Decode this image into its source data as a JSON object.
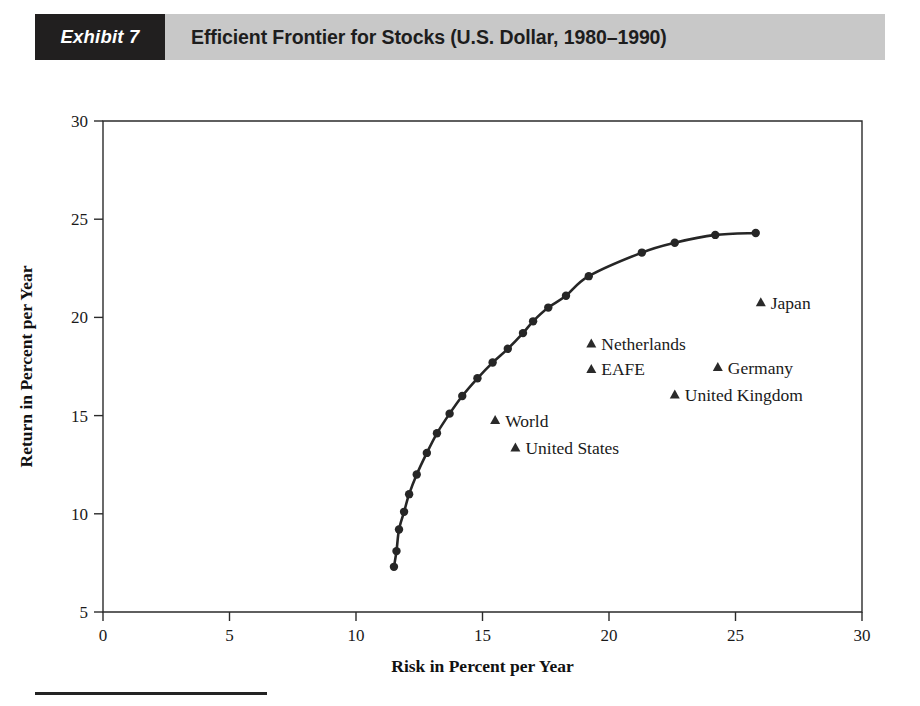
{
  "exhibit": {
    "tag": "Exhibit 7",
    "title": "Efficient Frontier for Stocks (U.S. Dollar, 1980–1990)"
  },
  "chart_data": {
    "type": "scatter",
    "title": "Efficient Frontier for Stocks (U.S. Dollar, 1980–1990)",
    "xlabel": "Risk in Percent per Year",
    "ylabel": "Return in Percent per Year",
    "xlim": [
      0,
      30
    ],
    "ylim": [
      5,
      30
    ],
    "xticks": [
      0,
      5,
      10,
      15,
      20,
      25,
      30
    ],
    "yticks": [
      5,
      10,
      15,
      20,
      25,
      30
    ],
    "grid": false,
    "legend": "none",
    "series": [
      {
        "name": "Efficient Frontier",
        "type": "line",
        "marker": "circle",
        "points": [
          [
            11.5,
            7.3
          ],
          [
            11.6,
            8.1
          ],
          [
            11.7,
            9.2
          ],
          [
            11.9,
            10.1
          ],
          [
            12.1,
            11.0
          ],
          [
            12.4,
            12.0
          ],
          [
            12.8,
            13.1
          ],
          [
            13.2,
            14.1
          ],
          [
            13.7,
            15.1
          ],
          [
            14.2,
            16.0
          ],
          [
            14.8,
            16.9
          ],
          [
            15.4,
            17.7
          ],
          [
            16.0,
            18.4
          ],
          [
            16.6,
            19.2
          ],
          [
            17.0,
            19.8
          ],
          [
            17.6,
            20.5
          ],
          [
            18.3,
            21.1
          ],
          [
            19.2,
            22.1
          ],
          [
            21.3,
            23.3
          ],
          [
            22.6,
            23.8
          ],
          [
            24.2,
            24.2
          ],
          [
            25.8,
            24.3
          ]
        ]
      },
      {
        "name": "Countries",
        "type": "scatter",
        "marker": "triangle",
        "points": [
          {
            "label": "Japan",
            "risk": 26.0,
            "return": 20.8
          },
          {
            "label": "Netherlands",
            "risk": 19.3,
            "return": 18.7
          },
          {
            "label": "EAFE",
            "risk": 19.3,
            "return": 17.4
          },
          {
            "label": "Germany",
            "risk": 24.3,
            "return": 17.5
          },
          {
            "label": "United Kingdom",
            "risk": 22.6,
            "return": 16.1
          },
          {
            "label": "World",
            "risk": 15.5,
            "return": 14.8
          },
          {
            "label": "United States",
            "risk": 16.3,
            "return": 13.4
          }
        ]
      }
    ]
  },
  "colors": {
    "tag_background": "#211f1f",
    "title_band": "#c8c8c8",
    "ink": "#1a1a1a",
    "curve": "#262626"
  }
}
